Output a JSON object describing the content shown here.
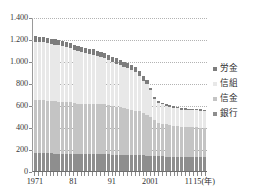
{
  "chart_data": {
    "type": "bar",
    "stacked": true,
    "title": "",
    "subtitle": "",
    "xlabel": "",
    "ylabel": "",
    "ylim": [
      0,
      1400
    ],
    "ytick_labels": [
      "0",
      "200",
      "400",
      "600",
      "800",
      "1.000",
      "1.200",
      "1.400"
    ],
    "ytick_values": [
      0,
      200,
      400,
      600,
      800,
      1000,
      1200,
      1400
    ],
    "grid": true,
    "grid_style": "dotted-horizontal",
    "legend_position": "right",
    "x_axis_unit": "15(年)",
    "xtick_labels": [
      "1971",
      "81",
      "91",
      "2001",
      "11",
      "15(年)"
    ],
    "xtick_indices": [
      0,
      10,
      20,
      30,
      40,
      44
    ],
    "categories": [
      "1971",
      "1972",
      "1973",
      "1974",
      "1975",
      "1976",
      "1977",
      "1978",
      "1979",
      "1980",
      "1981",
      "1982",
      "1983",
      "1984",
      "1985",
      "1986",
      "1987",
      "1988",
      "1989",
      "1990",
      "1991",
      "1992",
      "1993",
      "1994",
      "1995",
      "1996",
      "1997",
      "1998",
      "1999",
      "2000",
      "2001",
      "2002",
      "2003",
      "2004",
      "2005",
      "2006",
      "2007",
      "2008",
      "2009",
      "2010",
      "2011",
      "2012",
      "2013",
      "2014",
      "2015"
    ],
    "series": [
      {
        "name": "銀行",
        "color": "#8e8e8e",
        "values": [
          161,
          161,
          161,
          160,
          160,
          159,
          158,
          158,
          158,
          157,
          156,
          156,
          155,
          155,
          155,
          155,
          154,
          153,
          152,
          151,
          150,
          150,
          150,
          150,
          150,
          149,
          148,
          146,
          143,
          141,
          139,
          137,
          134,
          133,
          131,
          130,
          129,
          128,
          127,
          127,
          126,
          126,
          126,
          126,
          126
        ]
      },
      {
        "name": "信金",
        "color": "#c4c4c4",
        "values": [
          484,
          484,
          482,
          481,
          478,
          476,
          474,
          473,
          471,
          471,
          462,
          456,
          456,
          456,
          455,
          455,
          455,
          455,
          454,
          451,
          440,
          435,
          428,
          421,
          416,
          410,
          401,
          396,
          386,
          372,
          349,
          326,
          306,
          298,
          292,
          287,
          281,
          279,
          272,
          271,
          271,
          270,
          270,
          267,
          265
        ]
      },
      {
        "name": "信組",
        "color": "#e8e8e8",
        "values": [
          532,
          530,
          528,
          525,
          519,
          514,
          510,
          504,
          498,
          490,
          484,
          476,
          470,
          462,
          455,
          448,
          439,
          429,
          419,
          407,
          400,
          392,
          384,
          374,
          369,
          361,
          351,
          323,
          291,
          281,
          247,
          191,
          181,
          175,
          172,
          168,
          164,
          162,
          159,
          158,
          158,
          157,
          157,
          155,
          153
        ]
      },
      {
        "name": "労金",
        "color": "#7d7d7d",
        "values": [
          47,
          47,
          47,
          47,
          47,
          47,
          47,
          47,
          47,
          47,
          47,
          47,
          47,
          47,
          47,
          47,
          47,
          47,
          47,
          47,
          47,
          47,
          47,
          47,
          47,
          47,
          47,
          47,
          41,
          34,
          24,
          21,
          16,
          14,
          13,
          13,
          13,
          13,
          13,
          13,
          13,
          13,
          13,
          13,
          13
        ]
      }
    ]
  },
  "legend": {
    "items": [
      {
        "label": "労金",
        "color": "#7d7d7d"
      },
      {
        "label": "信組",
        "color": "#e8e8e8"
      },
      {
        "label": "信金",
        "color": "#c4c4c4"
      },
      {
        "label": "銀行",
        "color": "#8e8e8e"
      }
    ]
  },
  "axis": {
    "y_labels": [
      "1.400",
      "1.200",
      "1.000",
      "800",
      "600",
      "400",
      "200",
      "0"
    ],
    "x_labels": [
      {
        "text": "1971",
        "index": 0
      },
      {
        "text": "81",
        "index": 10
      },
      {
        "text": "91",
        "index": 20
      },
      {
        "text": "2001",
        "index": 30
      },
      {
        "text": "11",
        "index": 40
      },
      {
        "text": "15(年)",
        "index": 44
      }
    ]
  }
}
